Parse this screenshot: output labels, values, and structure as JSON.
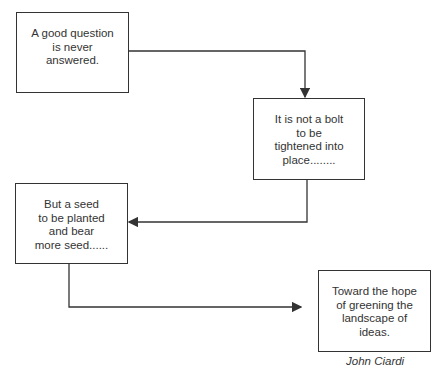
{
  "boxes": [
    {
      "id": "box1",
      "text": "A good question\nis never\nanswered."
    },
    {
      "id": "box2",
      "text": "It is not a bolt\nto be\ntightened into\nplace........"
    },
    {
      "id": "box3",
      "text": "But a seed\nto be planted\nand bear\nmore seed......"
    },
    {
      "id": "box4",
      "text": "Toward the hope\nof greening the\nlandscape of\nideas."
    }
  ],
  "attribution": "John Ciardi",
  "colors": {
    "line": "#333333",
    "background": "#ffffff"
  }
}
